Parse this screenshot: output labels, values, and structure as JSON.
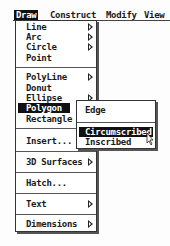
{
  "menubar": {
    "items": [
      {
        "label": "Draw",
        "active": true
      },
      {
        "label": "Construct"
      },
      {
        "label": "Modify"
      },
      {
        "label": "View"
      }
    ]
  },
  "draw_menu": {
    "items": [
      {
        "label": "Line",
        "submenu": true
      },
      {
        "label": "Arc",
        "submenu": true
      },
      {
        "label": "Circle",
        "submenu": true
      },
      {
        "label": "Point"
      },
      {
        "label": "PolyLine",
        "submenu": true
      },
      {
        "label": "Donut"
      },
      {
        "label": "Ellipse",
        "submenu": true
      },
      {
        "label": "Polygon",
        "highlighted": true
      },
      {
        "label": "Rectangle"
      },
      {
        "label": "Insert..."
      },
      {
        "label": "3D Surfaces",
        "submenu": true
      },
      {
        "label": "Hatch..."
      },
      {
        "label": "Text",
        "submenu": true
      },
      {
        "label": "Dimensions",
        "submenu": true
      }
    ]
  },
  "polygon_submenu": {
    "items": [
      {
        "label": "Edge"
      },
      {
        "label": "Circumscribed",
        "highlighted": true
      },
      {
        "label": "Inscribed"
      }
    ]
  }
}
